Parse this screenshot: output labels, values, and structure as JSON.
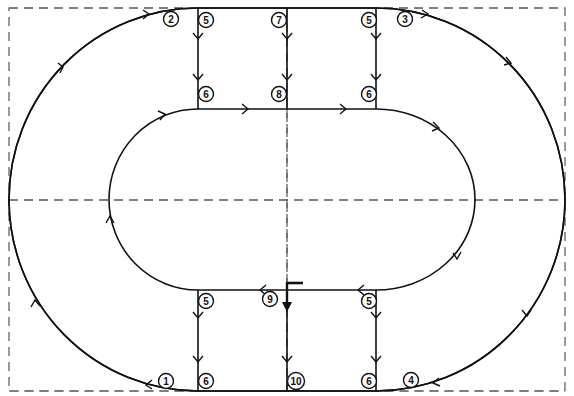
{
  "diagram": {
    "type": "track-loop-flow",
    "colors": {
      "line": "#111111",
      "guide": "#555555",
      "background": "#ffffff"
    },
    "guides": {
      "frame": {
        "x": 9,
        "y": 8,
        "w": 556,
        "h": 383
      },
      "center_x": 287,
      "center_y": 200
    },
    "nodes": [
      {
        "id": "n1",
        "label": "1",
        "x": 166,
        "y": 381
      },
      {
        "id": "n2",
        "label": "2",
        "x": 171,
        "y": 19
      },
      {
        "id": "n3",
        "label": "3",
        "x": 405,
        "y": 19
      },
      {
        "id": "n4",
        "label": "4",
        "x": 411,
        "y": 380
      },
      {
        "id": "n5a",
        "label": "5",
        "x": 206,
        "y": 20
      },
      {
        "id": "n5b",
        "label": "5",
        "x": 369,
        "y": 20
      },
      {
        "id": "n5c",
        "label": "5",
        "x": 206,
        "y": 301
      },
      {
        "id": "n5d",
        "label": "5",
        "x": 369,
        "y": 301
      },
      {
        "id": "n6a",
        "label": "6",
        "x": 206,
        "y": 94
      },
      {
        "id": "n6b",
        "label": "6",
        "x": 369,
        "y": 94
      },
      {
        "id": "n6c",
        "label": "6",
        "x": 206,
        "y": 381
      },
      {
        "id": "n6d",
        "label": "6",
        "x": 369,
        "y": 381
      },
      {
        "id": "n7",
        "label": "7",
        "x": 279,
        "y": 20
      },
      {
        "id": "n8",
        "label": "8",
        "x": 279,
        "y": 94
      },
      {
        "id": "n9",
        "label": "9",
        "x": 270,
        "y": 299
      },
      {
        "id": "n10",
        "label": "10",
        "x": 296,
        "y": 381
      }
    ],
    "start_marker": {
      "x": 287,
      "y_top": 283,
      "y_tip": 312,
      "flag_to_x": 303
    }
  }
}
